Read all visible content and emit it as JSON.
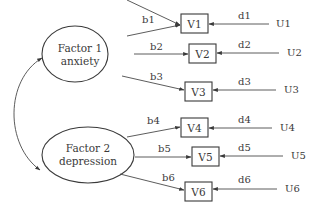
{
  "diagram": {
    "type": "structural-equation-model",
    "factors": [
      {
        "id": "F1",
        "line1": "Factor 1",
        "line2": "anxiety",
        "cx": 75,
        "cy": 54,
        "rx": 33,
        "ry": 28
      },
      {
        "id": "F2",
        "line1": "Factor 2",
        "line2": "depression",
        "cx": 68,
        "cy": 164,
        "rx": 33,
        "ry": 27
      }
    ],
    "variables": [
      {
        "id": "V1",
        "label": "V1",
        "x": 181,
        "y": 14,
        "w": 27,
        "h": 19
      },
      {
        "id": "V2",
        "label": "V2",
        "x": 189,
        "y": 43,
        "w": 27,
        "h": 19
      },
      {
        "id": "V3",
        "label": "V3",
        "x": 185,
        "y": 82,
        "w": 27,
        "h": 19
      },
      {
        "id": "V4",
        "label": "V4",
        "x": 181,
        "y": 118,
        "w": 27,
        "h": 19
      },
      {
        "id": "V5",
        "label": "V5",
        "x": 192,
        "y": 146,
        "w": 27,
        "h": 19
      },
      {
        "id": "V6",
        "label": "V6",
        "x": 185,
        "y": 182,
        "w": 27,
        "h": 19
      }
    ],
    "loadings": [
      {
        "label": "b1",
        "from": "F1",
        "to": "V1"
      },
      {
        "label": "b2",
        "from": "F1",
        "to": "V2"
      },
      {
        "label": "b3",
        "from": "F1",
        "to": "V3"
      },
      {
        "label": "b4",
        "from": "F2",
        "to": "V4"
      },
      {
        "label": "b5",
        "from": "F2",
        "to": "V5"
      },
      {
        "label": "b6",
        "from": "F2",
        "to": "V6"
      }
    ],
    "errors": [
      {
        "label": "U1",
        "path": "d1",
        "to": "V1"
      },
      {
        "label": "U2",
        "path": "d2",
        "to": "V2"
      },
      {
        "label": "U3",
        "path": "d3",
        "to": "V3"
      },
      {
        "label": "U4",
        "path": "d4",
        "to": "V4"
      },
      {
        "label": "U5",
        "path": "d5",
        "to": "V5"
      },
      {
        "label": "U6",
        "path": "d6",
        "to": "V6"
      }
    ],
    "covariance": {
      "between": [
        "F1",
        "F2"
      ],
      "style": "double-headed-curved-arrow"
    }
  }
}
